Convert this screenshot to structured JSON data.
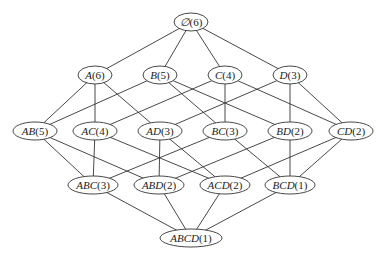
{
  "diagram": {
    "type": "subset-lattice",
    "colors": {
      "line": "#333333",
      "fill": "#ffffff",
      "text": "#222222"
    },
    "nodes": [
      {
        "id": "empty",
        "set": "∅",
        "count": "(6)",
        "x": 191,
        "y": 22,
        "rx": 17,
        "ry": 9
      },
      {
        "id": "A",
        "set": "A",
        "count": "(6)",
        "x": 95,
        "y": 75,
        "rx": 17,
        "ry": 9
      },
      {
        "id": "B",
        "set": "B",
        "count": "(5)",
        "x": 160,
        "y": 75,
        "rx": 17,
        "ry": 9
      },
      {
        "id": "C",
        "set": "C",
        "count": "(4)",
        "x": 225,
        "y": 75,
        "rx": 17,
        "ry": 9
      },
      {
        "id": "D",
        "set": "D",
        "count": "(3)",
        "x": 290,
        "y": 75,
        "rx": 17,
        "ry": 9
      },
      {
        "id": "AB",
        "set": "AB",
        "count": "(5)",
        "x": 35,
        "y": 131,
        "rx": 22,
        "ry": 9
      },
      {
        "id": "AC",
        "set": "AC",
        "count": "(4)",
        "x": 95,
        "y": 131,
        "rx": 22,
        "ry": 9
      },
      {
        "id": "AD",
        "set": "AD",
        "count": "(3)",
        "x": 160,
        "y": 131,
        "rx": 22,
        "ry": 9
      },
      {
        "id": "BC",
        "set": "BC",
        "count": "(3)",
        "x": 225,
        "y": 131,
        "rx": 22,
        "ry": 9
      },
      {
        "id": "BD",
        "set": "BD",
        "count": "(2)",
        "x": 290,
        "y": 131,
        "rx": 22,
        "ry": 9
      },
      {
        "id": "CD",
        "set": "CD",
        "count": "(2)",
        "x": 351,
        "y": 131,
        "rx": 22,
        "ry": 9
      },
      {
        "id": "ABC",
        "set": "ABC",
        "count": "(3)",
        "x": 93,
        "y": 185,
        "rx": 25,
        "ry": 9
      },
      {
        "id": "ABD",
        "set": "ABD",
        "count": "(2)",
        "x": 159,
        "y": 185,
        "rx": 25,
        "ry": 9
      },
      {
        "id": "ACD",
        "set": "ACD",
        "count": "(2)",
        "x": 225,
        "y": 185,
        "rx": 25,
        "ry": 9
      },
      {
        "id": "BCD",
        "set": "BCD",
        "count": "(1)",
        "x": 290,
        "y": 185,
        "rx": 25,
        "ry": 9
      },
      {
        "id": "ABCD",
        "set": "ABCD",
        "count": "(1)",
        "x": 191,
        "y": 238,
        "rx": 31,
        "ry": 9
      }
    ],
    "edges": [
      [
        "empty",
        "A"
      ],
      [
        "empty",
        "B"
      ],
      [
        "empty",
        "C"
      ],
      [
        "empty",
        "D"
      ],
      [
        "A",
        "AB"
      ],
      [
        "A",
        "AC"
      ],
      [
        "A",
        "AD"
      ],
      [
        "B",
        "AB"
      ],
      [
        "B",
        "BC"
      ],
      [
        "B",
        "BD"
      ],
      [
        "C",
        "AC"
      ],
      [
        "C",
        "BC"
      ],
      [
        "C",
        "CD"
      ],
      [
        "D",
        "AD"
      ],
      [
        "D",
        "BD"
      ],
      [
        "D",
        "CD"
      ],
      [
        "AB",
        "ABC"
      ],
      [
        "AB",
        "ABD"
      ],
      [
        "AC",
        "ABC"
      ],
      [
        "AC",
        "ACD"
      ],
      [
        "AD",
        "ABD"
      ],
      [
        "AD",
        "ACD"
      ],
      [
        "BC",
        "ABC"
      ],
      [
        "BC",
        "BCD"
      ],
      [
        "BD",
        "ABD"
      ],
      [
        "BD",
        "BCD"
      ],
      [
        "CD",
        "ACD"
      ],
      [
        "CD",
        "BCD"
      ],
      [
        "ABC",
        "ABCD"
      ],
      [
        "ABD",
        "ABCD"
      ],
      [
        "ACD",
        "ABCD"
      ],
      [
        "BCD",
        "ABCD"
      ]
    ]
  }
}
